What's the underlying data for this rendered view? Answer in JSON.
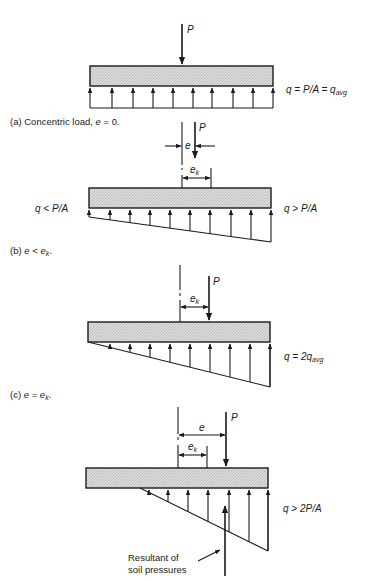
{
  "figure": {
    "panels": [
      {
        "id": "a",
        "caption": "(a) Concentric load, e = 0.",
        "caption_parts": {
          "prefix": "(a) Concentric load, ",
          "var": "e",
          "suffix": " = 0."
        },
        "load_label": "P",
        "right_label": "q = P/A = q",
        "right_label_sub": "avg",
        "distribution": "uniform"
      },
      {
        "id": "b",
        "caption": "(b) e < e_k.",
        "caption_parts": {
          "prefix": "(b) ",
          "var": "e",
          "op": " < ",
          "var2": "e",
          "sub": "k",
          "suffix": "."
        },
        "load_label": "P",
        "dim_e": "e",
        "dim_ek": "e",
        "dim_ek_sub": "k",
        "left_label": "q < P/A",
        "right_label": "q > P/A",
        "distribution": "trapezoidal"
      },
      {
        "id": "c",
        "caption": "(c) e = e_k.",
        "caption_parts": {
          "prefix": "(c) ",
          "var": "e",
          "op": " = ",
          "var2": "e",
          "sub": "k",
          "suffix": "."
        },
        "load_label": "P",
        "dim_ek": "e",
        "dim_ek_sub": "k",
        "right_label": "q = 2q",
        "right_label_sub": "avg",
        "distribution": "triangular"
      },
      {
        "id": "d",
        "load_label": "P",
        "dim_e": "e",
        "dim_ek": "e",
        "dim_ek_sub": "k",
        "right_label": "q > 2P/A",
        "resultant_label_line1": "Resultant of",
        "resultant_label_line2": "soil pressures",
        "distribution": "partial-triangular"
      }
    ]
  },
  "colors": {
    "ink": "#1a1a1a",
    "footing_fill": "#d4d4d4",
    "background": "#ffffff"
  }
}
